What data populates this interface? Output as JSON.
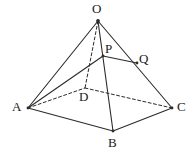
{
  "figure": {
    "name": "square-pyramid-diagram",
    "background_color": "#ffffff",
    "line_color": "#2b2b2b",
    "label_color": "#1a1a1a",
    "solid_stroke_width": 1.1,
    "dashed_stroke_width": 1.0,
    "dash_pattern": "3,2.4",
    "width": 193,
    "height": 154
  },
  "vertices": {
    "O": {
      "label": "O",
      "x": 98,
      "y": 21,
      "label_x": 92,
      "label_y": 2,
      "hidden": false
    },
    "A": {
      "label": "A",
      "x": 28,
      "y": 108,
      "label_x": 12,
      "label_y": 100,
      "hidden": false
    },
    "B": {
      "label": "B",
      "x": 113,
      "y": 131,
      "label_x": 108,
      "label_y": 136,
      "hidden": false
    },
    "C": {
      "label": "C",
      "x": 172,
      "y": 108,
      "label_x": 177,
      "label_y": 100,
      "hidden": false
    },
    "D": {
      "label": "D",
      "x": 85,
      "y": 88,
      "label_x": 79,
      "label_y": 90,
      "hidden": true
    },
    "P": {
      "label": "P",
      "x": 103,
      "y": 56,
      "label_x": 105,
      "label_y": 42,
      "hidden": false
    },
    "Q": {
      "label": "Q",
      "x": 137,
      "y": 63,
      "label_x": 139,
      "label_y": 52,
      "hidden": false
    }
  },
  "edges": {
    "solid": [
      {
        "name": "edge-O-A",
        "from": "O",
        "to": "A"
      },
      {
        "name": "edge-O-B",
        "from": "O",
        "to": "B"
      },
      {
        "name": "edge-O-C",
        "from": "O",
        "to": "C"
      },
      {
        "name": "edge-A-B",
        "from": "A",
        "to": "B"
      },
      {
        "name": "edge-B-C",
        "from": "B",
        "to": "C"
      },
      {
        "name": "segment-A-P",
        "from": "A",
        "to": "P"
      },
      {
        "name": "segment-P-Q",
        "from": "P",
        "to": "Q"
      }
    ],
    "dashed": [
      {
        "name": "edge-O-D",
        "from": "O",
        "to": "D"
      },
      {
        "name": "edge-A-D",
        "from": "A",
        "to": "D"
      },
      {
        "name": "edge-D-C",
        "from": "D",
        "to": "C"
      }
    ]
  },
  "labels": [
    {
      "key": "O",
      "text": "O"
    },
    {
      "key": "P",
      "text": "P"
    },
    {
      "key": "Q",
      "text": "Q"
    },
    {
      "key": "A",
      "text": "A"
    },
    {
      "key": "D",
      "text": "D"
    },
    {
      "key": "C",
      "text": "C"
    },
    {
      "key": "B",
      "text": "B"
    }
  ]
}
